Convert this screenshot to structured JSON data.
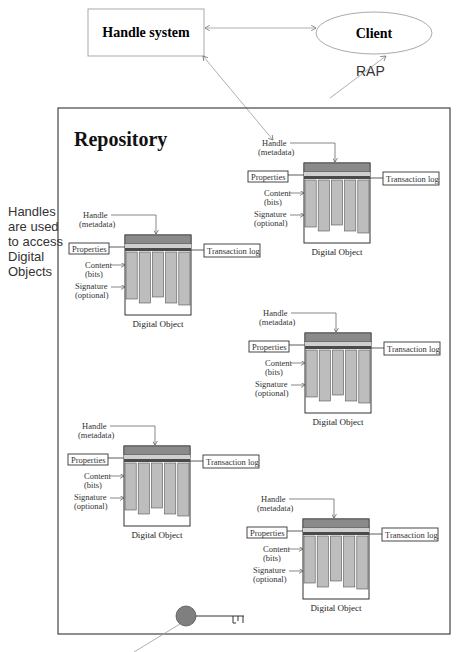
{
  "diagram": {
    "handle_system": {
      "label": "Handle system"
    },
    "client": {
      "label": "Client"
    },
    "rap_label": "RAP",
    "repository": {
      "title": "Repository"
    },
    "side_note": {
      "lines": [
        "Handles",
        "are used",
        "to access",
        "Digital",
        "Objects"
      ]
    },
    "digital_object_labels": {
      "handle_line1": "Handle",
      "handle_line2": "(metadata)",
      "properties": "Properties",
      "transaction_log": "Transaction log",
      "content_line1": "Content",
      "content_line2": "(bits)",
      "signature_line1": "Signature",
      "signature_line2": "(optional)",
      "caption": "Digital Object"
    },
    "digital_objects": [
      {
        "id": "do-1",
        "x": 304,
        "y": 163
      },
      {
        "id": "do-2",
        "x": 125,
        "y": 235
      },
      {
        "id": "do-3",
        "x": 305,
        "y": 333
      },
      {
        "id": "do-4",
        "x": 124,
        "y": 446
      },
      {
        "id": "do-5",
        "x": 303,
        "y": 519
      }
    ],
    "colors": {
      "handle_band": "#8a8a8a",
      "properties_band": "#cfcfcf",
      "log_band": "#4a4a4a",
      "content_column": "#bdbdbd",
      "key": "#7f7f7f",
      "connector": "#9a9a9a",
      "border": "#444444"
    }
  }
}
